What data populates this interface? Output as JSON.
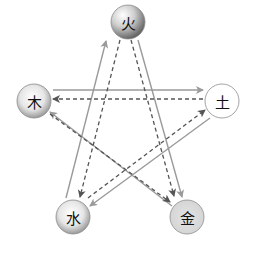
{
  "diagram": {
    "title": "",
    "colors": {
      "solid_line": "#9a9a9a",
      "dashed_line": "#555555",
      "node_border": "#8c8c8c"
    },
    "nodes": [
      {
        "id": "fire",
        "label": "火",
        "x": 128,
        "y": 22,
        "r": 17,
        "style": "dark-sphere"
      },
      {
        "id": "wood",
        "label": "木",
        "x": 34,
        "y": 101,
        "r": 17,
        "style": "medium-sphere"
      },
      {
        "id": "earth",
        "label": "土",
        "x": 222,
        "y": 101,
        "r": 17,
        "style": "white"
      },
      {
        "id": "water",
        "label": "水",
        "x": 73,
        "y": 217,
        "r": 17,
        "style": "medium-sphere"
      },
      {
        "id": "metal",
        "label": "金",
        "x": 187,
        "y": 217,
        "r": 17,
        "style": "light-grey"
      }
    ],
    "edges": [
      {
        "from": "water",
        "to": "fire",
        "style": "solid",
        "x1": 66,
        "y1": 198,
        "x2": 106,
        "y2": 41
      },
      {
        "from": "fire",
        "to": "metal",
        "style": "solid",
        "x1": 138,
        "y1": 40,
        "x2": 182,
        "y2": 197
      },
      {
        "from": "wood",
        "to": "earth",
        "style": "solid",
        "x1": 53,
        "y1": 90,
        "x2": 203,
        "y2": 90
      },
      {
        "from": "earth",
        "to": "water",
        "style": "solid",
        "x1": 210,
        "y1": 118,
        "x2": 90,
        "y2": 206
      },
      {
        "from": "metal",
        "to": "wood",
        "style": "solid",
        "x1": 172,
        "y1": 206,
        "x2": 50,
        "y2": 112
      },
      {
        "from": "fire",
        "to": "water",
        "style": "dashed",
        "x1": 120,
        "y1": 40,
        "x2": 80,
        "y2": 197
      },
      {
        "from": "fire",
        "to": "metal",
        "style": "dashed",
        "x1": 131,
        "y1": 40,
        "x2": 174,
        "y2": 196
      },
      {
        "from": "earth",
        "to": "wood",
        "style": "dashed",
        "x1": 203,
        "y1": 99,
        "x2": 53,
        "y2": 99
      },
      {
        "from": "water",
        "to": "earth",
        "style": "dashed",
        "x1": 88,
        "y1": 198,
        "x2": 205,
        "y2": 110
      },
      {
        "from": "wood",
        "to": "metal",
        "style": "dashed",
        "x1": 50,
        "y1": 114,
        "x2": 170,
        "y2": 202
      }
    ]
  }
}
